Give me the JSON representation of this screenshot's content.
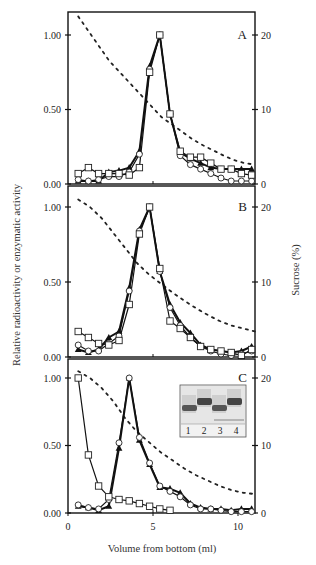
{
  "figure": {
    "ylabel_left": "Relative radioactivity or enzymatic activity",
    "ylabel_right": "Sucrose (%)",
    "xlabel": "Volume from bottom (ml)",
    "x_ticks": [
      "0",
      "5",
      "10"
    ],
    "left_ticks": [
      "0.00",
      "0.50",
      "1.00"
    ],
    "right_ticks": [
      "0",
      "10",
      "20"
    ],
    "inset": {
      "lanes": [
        "1",
        "2",
        "3",
        "4"
      ]
    }
  },
  "chart_data": [
    {
      "type": "line",
      "panel": "A",
      "xlabel": "Volume from bottom (ml)",
      "ylabel": "Relative radioactivity or enzymatic activity",
      "y2label": "Sucrose (%)",
      "xlim": [
        0,
        11
      ],
      "ylim": [
        0,
        1.05
      ],
      "y2lim": [
        0,
        21
      ],
      "x": [
        0.6,
        1.2,
        1.8,
        2.4,
        3.0,
        3.6,
        4.2,
        4.8,
        5.4,
        6.0,
        6.6,
        7.2,
        7.8,
        8.4,
        9.0,
        9.6,
        10.2,
        10.8
      ],
      "series": [
        {
          "name": "open squares",
          "marker": "square-open",
          "values": [
            0.07,
            0.11,
            0.07,
            0.07,
            0.07,
            0.06,
            0.11,
            0.75,
            1.0,
            0.47,
            0.22,
            0.18,
            0.18,
            0.14,
            0.1,
            0.1,
            0.07,
            0.06
          ]
        },
        {
          "name": "open circles",
          "marker": "circle-open",
          "values": [
            0.03,
            0.02,
            0.03,
            0.05,
            0.05,
            0.08,
            0.2,
            0.77,
            1.0,
            0.47,
            0.19,
            0.13,
            0.1,
            0.07,
            0.04,
            0.02,
            0.02,
            0.02
          ]
        },
        {
          "name": "filled triangles",
          "marker": "triangle-filled",
          "values": [
            0.02,
            0.02,
            0.02,
            0.08,
            0.09,
            0.11,
            0.22,
            0.79,
            1.0,
            0.47,
            0.21,
            0.17,
            0.14,
            0.11,
            0.1,
            0.1,
            0.1,
            0.1
          ]
        },
        {
          "name": "sucrose",
          "axis": "right",
          "style": "dotted",
          "values": [
            22.5,
            20.5,
            18.5,
            16.5,
            15.0,
            13.5,
            12.0,
            10.5,
            9.0,
            8.0,
            7.0,
            6.0,
            5.2,
            4.5,
            3.8,
            3.2,
            2.8,
            2.6
          ]
        }
      ],
      "annotations": [
        "A"
      ]
    },
    {
      "type": "line",
      "panel": "B",
      "xlim": [
        0,
        11
      ],
      "ylim": [
        0,
        1.05
      ],
      "y2lim": [
        0,
        21
      ],
      "x": [
        0.6,
        1.2,
        1.8,
        2.4,
        3.0,
        3.6,
        4.2,
        4.8,
        5.4,
        6.0,
        6.6,
        7.2,
        7.8,
        8.4,
        9.0,
        9.6,
        10.2,
        10.8
      ],
      "series": [
        {
          "name": "open squares",
          "marker": "square-open",
          "values": [
            0.17,
            0.13,
            0.09,
            0.08,
            0.11,
            0.35,
            0.82,
            1.0,
            0.59,
            0.24,
            0.19,
            0.13,
            0.07,
            0.05,
            0.04,
            0.03,
            0.01,
            0.05
          ]
        },
        {
          "name": "open circles",
          "marker": "circle-open",
          "values": [
            0.08,
            0.04,
            0.04,
            0.09,
            0.14,
            0.44,
            0.84,
            1.0,
            0.57,
            0.33,
            0.21,
            0.13,
            0.07,
            0.04,
            0.02,
            0.01,
            0.02,
            0.04
          ]
        },
        {
          "name": "filled triangles",
          "marker": "triangle-filled",
          "values": [
            0.05,
            0.03,
            0.05,
            0.13,
            0.17,
            0.46,
            0.85,
            1.0,
            0.57,
            0.35,
            0.23,
            0.16,
            0.08,
            0.05,
            0.04,
            0.03,
            0.04,
            0.07
          ]
        },
        {
          "name": "sucrose",
          "axis": "right",
          "style": "dotted",
          "values": [
            21.0,
            20.0,
            18.5,
            16.5,
            14.5,
            12.5,
            11.0,
            9.8,
            8.6,
            7.5,
            6.5,
            5.6,
            4.8,
            4.2,
            3.8,
            3.4
          ]
        }
      ],
      "annotations": [
        "B"
      ]
    },
    {
      "type": "line",
      "panel": "C",
      "xlim": [
        0,
        11
      ],
      "ylim": [
        0,
        1.05
      ],
      "y2lim": [
        0,
        21
      ],
      "x": [
        0.6,
        1.2,
        1.8,
        2.4,
        3.0,
        3.6,
        4.2,
        4.8,
        5.4,
        6.0,
        6.6,
        7.2,
        7.8,
        8.4,
        9.0,
        9.6,
        10.2,
        10.8
      ],
      "series": [
        {
          "name": "open squares",
          "marker": "square-open",
          "values": [
            1.0,
            0.43,
            0.2,
            0.12,
            0.1,
            0.09,
            0.07,
            0.05,
            0.03,
            0.02
          ]
        },
        {
          "name": "open circles",
          "marker": "circle-open",
          "values": [
            0.06,
            0.04,
            0.03,
            0.1,
            0.52,
            1.0,
            0.56,
            0.37,
            0.2,
            0.16,
            0.12,
            0.06,
            0.03,
            0.03,
            0.02,
            0.01,
            0.01,
            0.01
          ]
        },
        {
          "name": "filled triangles",
          "marker": "triangle-filled",
          "values": [
            0.05,
            0.04,
            0.02,
            0.05,
            0.48,
            1.0,
            0.54,
            0.36,
            0.19,
            0.18,
            0.15,
            0.07,
            0.04,
            0.03,
            0.03,
            0.02,
            0.03,
            0.03
          ]
        },
        {
          "name": "sucrose",
          "axis": "right",
          "style": "dotted",
          "values": [
            21.0,
            20.0,
            18.5,
            16.5,
            14.0,
            12.0,
            10.5,
            9.0,
            7.8,
            6.6,
            5.6,
            4.8,
            4.0,
            3.4,
            3.0,
            2.8
          ]
        }
      ],
      "annotations": [
        "C",
        "inset gel: lanes 1-4"
      ]
    }
  ]
}
